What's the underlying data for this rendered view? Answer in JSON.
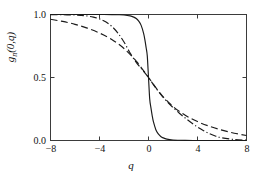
{
  "chart_data": {
    "type": "line",
    "title": "",
    "xlabel": "q",
    "ylabel": "g_n(0,q)",
    "ylabel_parts": {
      "base": "g",
      "subscript": "n",
      "arg": "(0,q)"
    },
    "xlim": [
      -8,
      8
    ],
    "ylim": [
      0,
      1
    ],
    "xticks": [
      -8,
      -4,
      0,
      4,
      8
    ],
    "xtick_labels": [
      "−8",
      "−4",
      "0",
      "4",
      "8"
    ],
    "yticks": [
      0.0,
      0.5,
      1.0
    ],
    "ytick_labels": [
      "0.0",
      "0.5",
      "1.0"
    ],
    "grid": false,
    "legend": "none",
    "frame": "box",
    "tick_direction": "in",
    "crossing_point": [
      0,
      0.5
    ],
    "series": [
      {
        "name": "solid",
        "style": "solid",
        "color": "#1a1a1a",
        "description": "steep sigmoid, sharp transition near q=0",
        "x": [
          -8,
          -7,
          -6,
          -5,
          -4,
          -3,
          -2.5,
          -2,
          -1.5,
          -1.2,
          -1,
          -0.8,
          -0.6,
          -0.4,
          -0.3,
          -0.2,
          -0.1,
          0,
          0.1,
          0.2,
          0.3,
          0.4,
          0.6,
          0.8,
          1,
          1.2,
          1.5,
          2,
          2.5,
          3,
          4,
          5,
          6,
          7,
          8
        ],
        "y": [
          1.0,
          1.0,
          1.0,
          1.0,
          1.0,
          0.999,
          0.998,
          0.996,
          0.989,
          0.979,
          0.968,
          0.948,
          0.914,
          0.851,
          0.802,
          0.741,
          0.672,
          0.5,
          0.328,
          0.259,
          0.198,
          0.149,
          0.086,
          0.052,
          0.032,
          0.021,
          0.011,
          0.004,
          0.002,
          0.001,
          0.0,
          0.0,
          0.0,
          0.0,
          0.0
        ]
      },
      {
        "name": "dash-dot",
        "style": "dashdot",
        "color": "#1a1a1a",
        "description": "medium-width sigmoid, flat until q=-4",
        "x": [
          -8,
          -7,
          -6,
          -5.5,
          -5,
          -4.5,
          -4,
          -3.5,
          -3,
          -2.5,
          -2,
          -1.5,
          -1,
          -0.5,
          0,
          0.5,
          1,
          1.5,
          2,
          2.5,
          3,
          3.5,
          4,
          4.5,
          5,
          5.5,
          6,
          7,
          8
        ],
        "y": [
          0.999,
          0.998,
          0.996,
          0.993,
          0.988,
          0.979,
          0.965,
          0.942,
          0.906,
          0.853,
          0.782,
          0.694,
          0.62,
          0.56,
          0.5,
          0.43,
          0.365,
          0.31,
          0.262,
          0.218,
          0.178,
          0.141,
          0.107,
          0.078,
          0.053,
          0.034,
          0.021,
          0.008,
          0.003
        ]
      },
      {
        "name": "dashed",
        "style": "dashed",
        "color": "#1a1a1a",
        "description": "broad gradual sigmoid, decays slowly to ~0.04 at q=8",
        "x": [
          -8,
          -7,
          -6,
          -5,
          -4,
          -3,
          -2,
          -1,
          0,
          1,
          2,
          3,
          4,
          5,
          6,
          7,
          8
        ],
        "y": [
          0.962,
          0.945,
          0.922,
          0.892,
          0.853,
          0.802,
          0.73,
          0.63,
          0.5,
          0.37,
          0.27,
          0.2,
          0.15,
          0.112,
          0.082,
          0.058,
          0.04
        ]
      }
    ]
  }
}
